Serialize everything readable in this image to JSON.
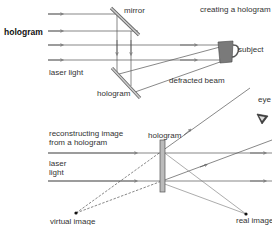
{
  "labels": {
    "main_title": "hologram",
    "creating_title": "creating a hologram",
    "mirror": "mirror",
    "subject": "subject",
    "laser_light_top": "laser light",
    "hologram_top": "hologram",
    "defracted_beam": "defracted beam",
    "eye": "eye",
    "reconstructing_line1": "reconstructing image",
    "reconstructing_line2": "from a hologram",
    "laser_bottom_line1": "laser",
    "laser_bottom_line2": "light",
    "hologram_bottom": "hologram",
    "virtual_image": "virtual image",
    "real_image": "real image"
  },
  "colors": {
    "line": "#555555",
    "mirror_fill": "#bbbbbb",
    "subject_fill": "#777777",
    "text": "#333333"
  }
}
